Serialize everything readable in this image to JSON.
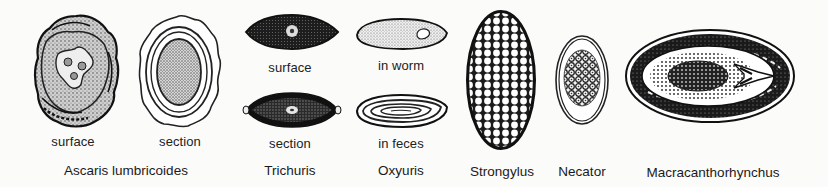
{
  "figure": {
    "specimens": [
      {
        "id": "ascaris",
        "name": "Ascaris lumbricoides",
        "views": [
          {
            "label": "surface"
          },
          {
            "label": "section"
          }
        ]
      },
      {
        "id": "trichuris",
        "name": "Trichuris",
        "views": [
          {
            "label": "surface"
          },
          {
            "label": "section"
          }
        ]
      },
      {
        "id": "oxyuris",
        "name": "Oxyuris",
        "views": [
          {
            "label": "in worm"
          },
          {
            "label": "in feces"
          }
        ]
      },
      {
        "id": "strongylus",
        "name": "Strongylus",
        "views": []
      },
      {
        "id": "necator",
        "name": "Necator",
        "views": []
      },
      {
        "id": "macracanthorhynchus",
        "name": "Macracanthorhynchus",
        "views": []
      }
    ]
  },
  "colors": {
    "background": "#fbfbfa",
    "ink": "#1c1c1c"
  }
}
